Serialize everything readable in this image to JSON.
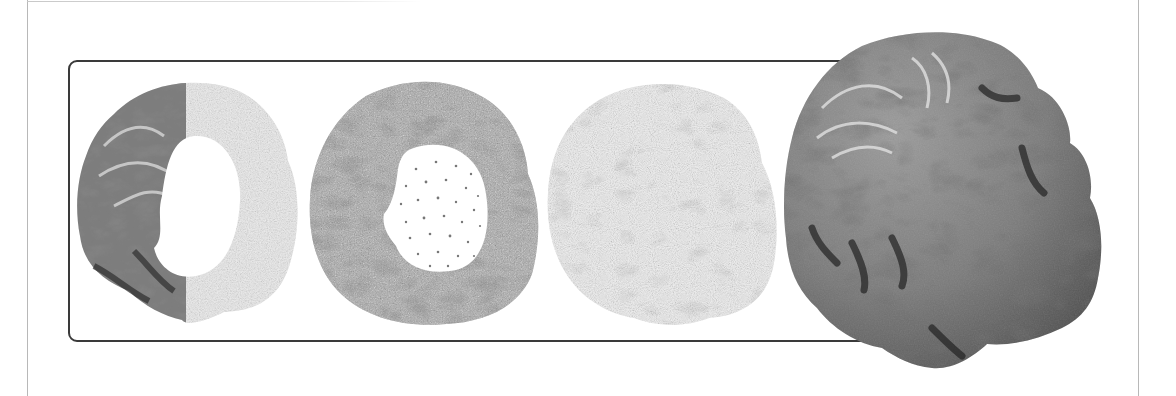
{
  "figure": {
    "panels": [
      {
        "id": "panel-1",
        "style": "half shaded surface / half stippled point cloud with cutaway hole"
      },
      {
        "id": "panel-2",
        "style": "dense stippled surface with cutaway showing sparse interior points"
      },
      {
        "id": "panel-3",
        "style": "light stippled point rendering"
      },
      {
        "id": "panel-4",
        "style": "full shaded surface rendering (enlarged, overlapping frame)"
      }
    ],
    "colors": {
      "frame_border": "#3a3a3a",
      "page_edge": "#b8b8b8",
      "surface_mid": "#7a7a7a",
      "surface_dark": "#3c3c3c",
      "surface_highlight": "#d8d8d8",
      "stipple_light": "#d0d0d0",
      "background": "#ffffff"
    }
  }
}
